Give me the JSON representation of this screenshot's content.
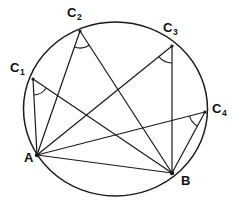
{
  "figure": {
    "type": "geometry-diagram",
    "canvas": {
      "width": 235,
      "height": 206
    },
    "stroke_color": "#1a1a1a",
    "background_color": "#ffffff"
  },
  "circle": {
    "name": "circumscribed-circle",
    "cx": 115.5,
    "cy": 109,
    "rx": 92,
    "ry": 87
  },
  "points": [
    {
      "id": "A",
      "base": "A",
      "sub": "",
      "x": 37,
      "y": 155,
      "label_x": 24,
      "label_y": 159
    },
    {
      "id": "B",
      "base": "B",
      "sub": "",
      "x": 172,
      "y": 173,
      "label_x": 181,
      "label_y": 182
    },
    {
      "id": "C1",
      "base": "C",
      "sub": "1",
      "x": 33,
      "y": 79,
      "label_x": 10,
      "label_y": 69
    },
    {
      "id": "C2",
      "base": "C",
      "sub": "2",
      "x": 80,
      "y": 31,
      "label_x": 67,
      "label_y": 14
    },
    {
      "id": "C3",
      "base": "C",
      "sub": "3",
      "x": 172,
      "y": 46,
      "label_x": 163,
      "label_y": 29
    },
    {
      "id": "C4",
      "base": "C",
      "sub": "4",
      "x": 205,
      "y": 112,
      "label_x": 212,
      "label_y": 110
    }
  ],
  "segments": [
    {
      "name": "chord-AB",
      "from": "A",
      "to": "B"
    },
    {
      "name": "chord-A-C1",
      "from": "A",
      "to": "C1"
    },
    {
      "name": "chord-A-C2",
      "from": "A",
      "to": "C2"
    },
    {
      "name": "chord-A-C3",
      "from": "A",
      "to": "C3"
    },
    {
      "name": "chord-A-C4",
      "from": "A",
      "to": "C4"
    },
    {
      "name": "chord-B-C1",
      "from": "B",
      "to": "C1"
    },
    {
      "name": "chord-B-C2",
      "from": "B",
      "to": "C2"
    },
    {
      "name": "chord-B-C3",
      "from": "B",
      "to": "C3"
    },
    {
      "name": "chord-B-C4",
      "from": "B",
      "to": "C4"
    }
  ],
  "angle_marks": [
    {
      "name": "angle-arc-C1",
      "vertex": "C1",
      "radius": 16
    },
    {
      "name": "angle-arc-C2",
      "vertex": "C2",
      "radius": 17
    },
    {
      "name": "angle-arc-C3",
      "vertex": "C3",
      "radius": 17
    },
    {
      "name": "angle-arc-C4",
      "vertex": "C4",
      "radius": 16
    }
  ],
  "labels": {
    "A": "A",
    "B": "B",
    "C1_base": "C",
    "C1_sub": "1",
    "C2_base": "C",
    "C2_sub": "2",
    "C3_base": "C",
    "C3_sub": "3",
    "C4_base": "C",
    "C4_sub": "4"
  }
}
